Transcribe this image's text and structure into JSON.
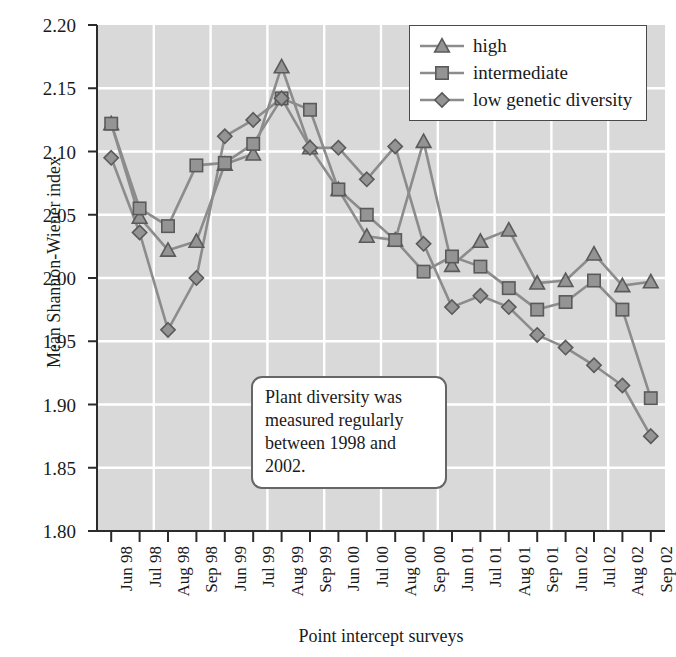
{
  "chart_data": {
    "type": "line",
    "title": "",
    "xlabel": "Point intercept surveys",
    "ylabel": "Mean Shannon-Wiener index",
    "ylim": [
      1.8,
      2.2
    ],
    "ytick_step": 0.05,
    "grid": true,
    "legend_position": "top-right",
    "categories": [
      "Jun 98",
      "Jul 98",
      "Aug 98",
      "Sep 98",
      "Jun 99",
      "Jul 99",
      "Aug 99",
      "Sep 99",
      "Jun 00",
      "Jul 00",
      "Aug 00",
      "Sep 00",
      "Jun 01",
      "Jul 01",
      "Aug 01",
      "Sep 01",
      "Jun 02",
      "Jul 02",
      "Aug 02",
      "Sep 02"
    ],
    "ytick_labels": [
      "2.20",
      "2.15",
      "2.10",
      "2.05",
      "2.00",
      "1.95",
      "1.90",
      "1.85",
      "1.80"
    ],
    "ytick_values": [
      2.2,
      2.15,
      2.1,
      2.05,
      2.0,
      1.95,
      1.9,
      1.85,
      1.8
    ],
    "series": [
      {
        "name": "high",
        "marker": "triangle",
        "values": [
          2.122,
          2.048,
          2.022,
          2.029,
          2.09,
          2.098,
          2.167,
          2.103,
          2.07,
          2.033,
          2.03,
          2.108,
          2.01,
          2.029,
          2.038,
          1.996,
          1.998,
          2.019,
          1.994,
          1.997
        ]
      },
      {
        "name": "intermediate",
        "marker": "square",
        "values": [
          2.122,
          2.055,
          2.041,
          2.089,
          2.091,
          2.106,
          2.142,
          2.133,
          2.07,
          2.05,
          2.03,
          2.005,
          2.017,
          2.009,
          1.992,
          1.975,
          1.981,
          1.998,
          1.975,
          1.905
        ]
      },
      {
        "name": "low genetic diversity",
        "marker": "diamond",
        "values": [
          2.095,
          2.036,
          1.959,
          2.0,
          2.112,
          2.125,
          2.142,
          2.103,
          2.103,
          2.078,
          2.104,
          2.027,
          1.977,
          1.986,
          1.977,
          1.955,
          1.945,
          1.931,
          1.915,
          1.875
        ]
      }
    ],
    "annotation": {
      "text": "Plant diversity was measured regularly between 1998 and 2002."
    },
    "colors": {
      "plot_background": "#d9d9d9",
      "gridline": "#ffffff",
      "axis": "#2b2b2b",
      "series_line": "#8c8c8c",
      "marker_fill": "#949494",
      "marker_stroke": "#5a5a5a",
      "text": "#1a1a1a"
    }
  },
  "legend": {
    "items": [
      {
        "label": "high",
        "marker": "triangle"
      },
      {
        "label": "intermediate",
        "marker": "square"
      },
      {
        "label": "low genetic diversity",
        "marker": "diamond"
      }
    ]
  },
  "axes": {
    "y_title": "Mean Shannon-Wiener index",
    "x_title": "Point intercept surveys"
  },
  "annotation": {
    "text": "Plant diversity was measured regularly between 1998 and 2002."
  }
}
